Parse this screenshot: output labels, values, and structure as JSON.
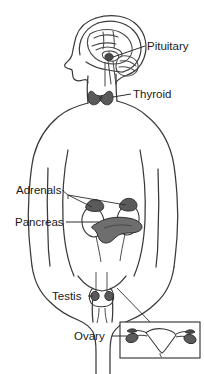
{
  "figure": {
    "background_color": "#ffffff",
    "outline_color": "#3a3a3a",
    "gland_fill_color": "#6e6e6e",
    "gland_dark_color": "#4a4a4a",
    "label_color": "#1a1a1a",
    "canvas": {
      "width": 204,
      "height": 374
    }
  },
  "labels": {
    "pituitary": "Pituitary",
    "thyroid": "Thyroid",
    "adrenals": "Adrenals",
    "pancreas": "Pancreas",
    "testis": "Testis",
    "ovary": "Ovary"
  },
  "structures": {
    "body": "human-body-outline",
    "head": "head-profile-sagittal-section",
    "brain": "brain-sagittal-view",
    "pituitary_gland": "pituitary-gland",
    "thyroid_gland": "thyroid-gland-bowtie",
    "kidneys": "kidney-pair",
    "adrenal_glands": "adrenal-gland-pair",
    "pancreas_organ": "pancreas-organ",
    "testis_organ": "testis-pair",
    "uterus_inset": "uterus-with-ovaries-inset-box",
    "ovary_organs": "ovary-pair"
  }
}
